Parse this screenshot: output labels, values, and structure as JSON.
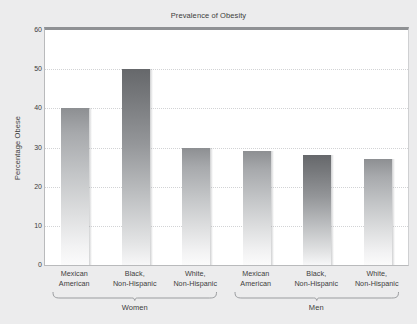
{
  "chart_data": {
    "type": "bar",
    "title": "Prevalence of Obesity",
    "xlabel": "",
    "ylabel": "Percentage Obese",
    "ylim": [
      0,
      60
    ],
    "yticks": [
      0,
      10,
      20,
      30,
      40,
      50,
      60
    ],
    "grid": true,
    "legend": "none",
    "categories": [
      "Mexican American",
      "Black, Non-Hispanic",
      "White, Non-Hispanic",
      "Mexican American",
      "Black, Non-Hispanic",
      "White, Non-Hispanic"
    ],
    "values": [
      40,
      50,
      30,
      29,
      28,
      27
    ],
    "groups": [
      {
        "label": "Women",
        "categories": [
          "Mexican American",
          "Black, Non-Hispanic",
          "White, Non-Hispanic"
        ],
        "values": [
          40,
          50,
          30
        ]
      },
      {
        "label": "Men",
        "categories": [
          "Mexican American",
          "Black, Non-Hispanic",
          "White, Non-Hispanic"
        ],
        "values": [
          29,
          28,
          27
        ]
      }
    ],
    "bars": [
      {
        "label_line1": "Mexican",
        "label_line2": "American",
        "value": 40,
        "group": "Women",
        "shade": "light"
      },
      {
        "label_line1": "Black,",
        "label_line2": "Non-Hispanic",
        "value": 50,
        "group": "Women",
        "shade": "dark"
      },
      {
        "label_line1": "White,",
        "label_line2": "Non-Hispanic",
        "value": 30,
        "group": "Women",
        "shade": "light"
      },
      {
        "label_line1": "Mexican",
        "label_line2": "American",
        "value": 29,
        "group": "Men",
        "shade": "light"
      },
      {
        "label_line1": "Black,",
        "label_line2": "Non-Hispanic",
        "value": 28,
        "group": "Men",
        "shade": "dark"
      },
      {
        "label_line1": "White,",
        "label_line2": "Non-Hispanic",
        "value": 27,
        "group": "Men",
        "shade": "light"
      }
    ],
    "colors": {
      "page_background": "#ececed",
      "plot_background": "#ffffff",
      "bar_light_top": "#8d8f92",
      "bar_dark_top": "#66686b",
      "bar_bottom": "#fbfbfb",
      "axis": "#8f9194",
      "gridline": "#d2d3d5",
      "text": "#3c3c3c"
    }
  }
}
